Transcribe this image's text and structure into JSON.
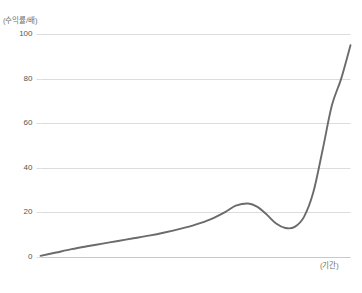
{
  "title": {
    "text": "",
    "visible": false
  },
  "axes": {
    "y_unit_label": "(수익률/배)",
    "x_unit_label": "(기간)"
  },
  "colors": {
    "line": "#6b6b6b",
    "grid": "#dcdcdc",
    "axis_text": "#545454",
    "unit_text": "#6d6d6d",
    "background": "#ffffff"
  },
  "chart_data": {
    "type": "line",
    "title": "",
    "xlabel": "(기간)",
    "ylabel": "(수익률/배)",
    "ylim": [
      0,
      100
    ],
    "xlim": [
      0,
      100
    ],
    "yticks": [
      0,
      20,
      40,
      60,
      80,
      100
    ],
    "ytick_labels": [
      "0",
      "20",
      "40",
      "60",
      "80",
      "100"
    ],
    "xticks": [],
    "xtick_labels": [],
    "grid": true,
    "grid_axis": "y",
    "legend": null,
    "series": [
      {
        "name": "수익률",
        "color": "#6b6b6b",
        "x": [
          0,
          5,
          10,
          15,
          20,
          25,
          30,
          35,
          40,
          45,
          50,
          55,
          60,
          63,
          67,
          70,
          73,
          76,
          79,
          82,
          85,
          88,
          91,
          94,
          97,
          100
        ],
        "y": [
          0.5,
          2.0,
          3.5,
          4.8,
          6.0,
          7.2,
          8.4,
          9.6,
          11.0,
          12.6,
          14.5,
          17.0,
          20.5,
          23.0,
          24.0,
          22.5,
          19.0,
          15.0,
          13.0,
          13.5,
          18.0,
          29.0,
          48.0,
          68.0,
          80.0,
          95.0
        ]
      }
    ]
  }
}
